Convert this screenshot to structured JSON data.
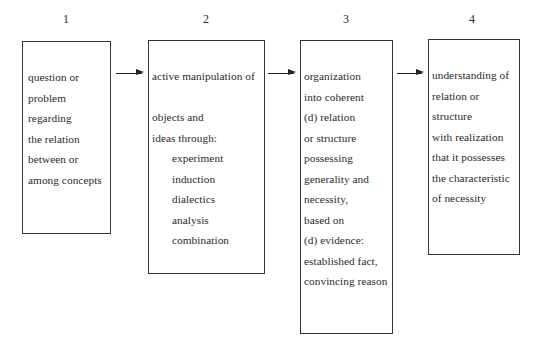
{
  "diagram": {
    "type": "flow",
    "direction": "left-to-right",
    "steps": [
      {
        "number": "1",
        "lines": [
          {
            "text": "question or",
            "indent": false
          },
          {
            "text": "problem",
            "indent": false
          },
          {
            "text": "regarding",
            "indent": false
          },
          {
            "text": "the relation",
            "indent": false
          },
          {
            "text": "between or",
            "indent": false
          },
          {
            "text": "among concepts",
            "indent": false
          }
        ]
      },
      {
        "number": "2",
        "lines": [
          {
            "text": "active manipulation of",
            "indent": false
          },
          {
            "text": "",
            "indent": false
          },
          {
            "text": "objects and",
            "indent": false
          },
          {
            "text": "ideas through:",
            "indent": false
          },
          {
            "text": "experiment",
            "indent": true
          },
          {
            "text": "induction",
            "indent": true
          },
          {
            "text": "dialectics",
            "indent": true
          },
          {
            "text": "analysis",
            "indent": true
          },
          {
            "text": "combination",
            "indent": true
          }
        ]
      },
      {
        "number": "3",
        "lines": [
          {
            "text": "organization",
            "indent": false
          },
          {
            "text": "into coherent",
            "indent": false
          },
          {
            "text": "(d) relation",
            "indent": false
          },
          {
            "text": "or structure",
            "indent": false
          },
          {
            "text": "possessing",
            "indent": false
          },
          {
            "text": "generality and",
            "indent": false
          },
          {
            "text": "necessity,",
            "indent": false
          },
          {
            "text": "based on",
            "indent": false
          },
          {
            "text": "(d) evidence:",
            "indent": false
          },
          {
            "text": "established fact,",
            "indent": false
          },
          {
            "text": "convincing reason",
            "indent": false
          }
        ]
      },
      {
        "number": "4",
        "lines": [
          {
            "text": "understanding of",
            "indent": false
          },
          {
            "text": "relation or",
            "indent": false
          },
          {
            "text": "structure",
            "indent": false
          },
          {
            "text": "with realization",
            "indent": false
          },
          {
            "text": "that it possesses",
            "indent": false
          },
          {
            "text": "the characteristic",
            "indent": false
          },
          {
            "text": "of necessity",
            "indent": false
          }
        ]
      }
    ],
    "arrows": [
      {
        "from": "1",
        "to": "2"
      },
      {
        "from": "2",
        "to": "3"
      },
      {
        "from": "3",
        "to": "4"
      }
    ],
    "colors": {
      "border": "#333333",
      "text": "#2a2a2a",
      "background": "#ffffff"
    }
  }
}
